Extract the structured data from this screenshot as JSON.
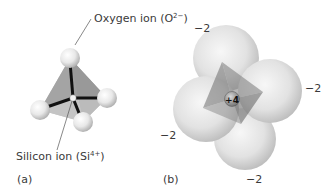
{
  "figure": {
    "panel_a": {
      "label": "(a)",
      "oxygen_label": {
        "text": "Oxygen ion (O",
        "sup": "2−",
        "close": ")"
      },
      "silicon_label": {
        "text": "Silicon ion (Si",
        "sup": "4+",
        "close": ")"
      }
    },
    "panel_b": {
      "label": "(b)",
      "center_charge": "+4",
      "oxygen_charges": [
        "−2",
        "−2",
        "−2",
        "−2"
      ]
    }
  },
  "colors": {
    "sphere_light": "#f4f4f4",
    "sphere_dark": "#b5b5b5",
    "tetra_face_dark": "#8a8a8a",
    "tetra_face_mid": "#a8a8a8",
    "tetra_face_light": "#c8c8c8",
    "bond": "#111111",
    "leader_line": "#555555"
  }
}
